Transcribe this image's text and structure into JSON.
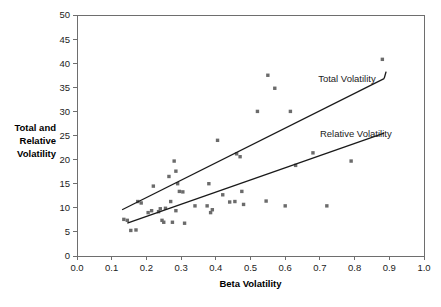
{
  "chart_data": {
    "type": "scatter",
    "title": "",
    "subtitle": "",
    "xlabel": "Beta Volatility",
    "ylabel": "Total and\nRelative\nVolatility",
    "ylabel_lines": [
      "Total and",
      "Relative",
      "Volatility"
    ],
    "xlim": [
      0.0,
      1.0
    ],
    "ylim": [
      0,
      50
    ],
    "xticks": [
      "0.0",
      "0.1",
      "0.2",
      "0.3",
      "0.4",
      "0.5",
      "0.6",
      "0.7",
      "0.8",
      "0.9",
      "1.0"
    ],
    "xtick_values": [
      0.0,
      0.1,
      0.2,
      0.3,
      0.4,
      0.5,
      0.6,
      0.7,
      0.8,
      0.9,
      1.0
    ],
    "yticks": [
      "0",
      "5",
      "10",
      "15",
      "20",
      "25",
      "30",
      "35",
      "40",
      "45",
      "50"
    ],
    "ytick_values": [
      0,
      5,
      10,
      15,
      20,
      25,
      30,
      35,
      40,
      45,
      50
    ],
    "grid": false,
    "legend_position": "inline-annotation",
    "marker_color": "#6b6b6b",
    "line_color": "#1a1a1a",
    "axis_color": "#6e6e6e",
    "points": [
      [
        0.135,
        7.6
      ],
      [
        0.145,
        7.4
      ],
      [
        0.155,
        5.3
      ],
      [
        0.17,
        5.4
      ],
      [
        0.175,
        11.3
      ],
      [
        0.185,
        11.0
      ],
      [
        0.205,
        9.0
      ],
      [
        0.215,
        9.4
      ],
      [
        0.22,
        14.5
      ],
      [
        0.235,
        9.2
      ],
      [
        0.24,
        9.8
      ],
      [
        0.245,
        7.4
      ],
      [
        0.25,
        7.0
      ],
      [
        0.255,
        9.9
      ],
      [
        0.265,
        16.5
      ],
      [
        0.27,
        11.3
      ],
      [
        0.275,
        7.0
      ],
      [
        0.28,
        19.7
      ],
      [
        0.285,
        17.6
      ],
      [
        0.285,
        9.4
      ],
      [
        0.29,
        15.0
      ],
      [
        0.295,
        13.4
      ],
      [
        0.305,
        13.3
      ],
      [
        0.31,
        6.8
      ],
      [
        0.34,
        10.4
      ],
      [
        0.375,
        10.4
      ],
      [
        0.38,
        15.0
      ],
      [
        0.385,
        9.0
      ],
      [
        0.39,
        9.6
      ],
      [
        0.405,
        24.0
      ],
      [
        0.42,
        12.7
      ],
      [
        0.44,
        11.2
      ],
      [
        0.455,
        11.3
      ],
      [
        0.46,
        21.2
      ],
      [
        0.47,
        20.6
      ],
      [
        0.475,
        13.4
      ],
      [
        0.48,
        10.7
      ],
      [
        0.52,
        30.0
      ],
      [
        0.545,
        11.4
      ],
      [
        0.55,
        37.5
      ],
      [
        0.57,
        34.8
      ],
      [
        0.6,
        10.4
      ],
      [
        0.615,
        30.0
      ],
      [
        0.63,
        18.8
      ],
      [
        0.68,
        21.4
      ],
      [
        0.72,
        10.4
      ],
      [
        0.79,
        19.7
      ],
      [
        0.88,
        40.8
      ]
    ],
    "series": [
      {
        "name": "Total Volatility",
        "type": "trendline",
        "label": "Total Volatility",
        "x_start": 0.13,
        "y_start": 9.6,
        "x_end": 0.885,
        "y_end": 36.8,
        "label_x": 0.695,
        "label_y": 36.0
      },
      {
        "name": "Relative Volatility",
        "type": "trendline",
        "label": "Relative Volatility",
        "x_start": 0.145,
        "y_start": 6.8,
        "x_end": 0.885,
        "y_end": 25.5,
        "label_x": 0.7,
        "label_y": 24.6
      }
    ]
  }
}
